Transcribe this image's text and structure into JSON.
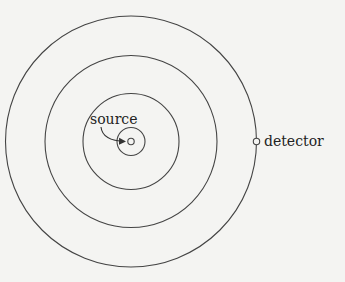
{
  "diagram": {
    "labels": {
      "source": "source",
      "detector": "detector"
    },
    "center": [
      131,
      141.5
    ],
    "circle_radii": [
      125.5,
      86,
      48,
      14
    ],
    "source_marker_radius": 3.5,
    "detector_marker": [
      256,
      141.5
    ],
    "colors": {
      "stroke": "#444444",
      "background": "#f4f4f2",
      "text": "#222222"
    }
  }
}
